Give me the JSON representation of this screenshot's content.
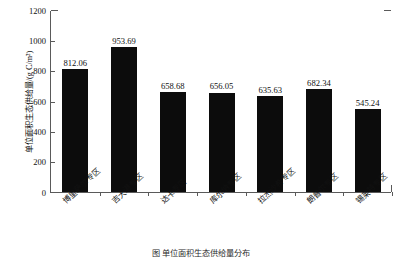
{
  "chart_data": {
    "type": "bar",
    "title": "",
    "subtitle": "",
    "xlabel": "",
    "ylabel": "单位面积生态供给量/(g C/m²)",
    "ylim": [
      0,
      1200
    ],
    "yticks": [
      0,
      200,
      400,
      600,
      800,
      1000,
      1200
    ],
    "ytick_labels": [
      "0",
      "200",
      "400",
      "600",
      "800",
      "1000",
      "1200"
    ],
    "grid": false,
    "legend": null,
    "legend_position": "none",
    "bar_color": "#0c0c0c",
    "axis_color": "#5a5a5a",
    "categories": [
      "博里萨尔专区",
      "吉大港专区",
      "达卡专区",
      "库尔纳专区",
      "拉杰沙希专区",
      "朗普尔专区",
      "锡莱特专区"
    ],
    "values": [
      812.06,
      953.69,
      658.68,
      656.05,
      635.63,
      682.34,
      545.24
    ],
    "data_labels": [
      "812.06",
      "953.69",
      "658.68",
      "656.05",
      "635.63",
      "682.34",
      "545.24"
    ]
  },
  "caption": {
    "text": "图    单位面积生态供给量分布"
  }
}
